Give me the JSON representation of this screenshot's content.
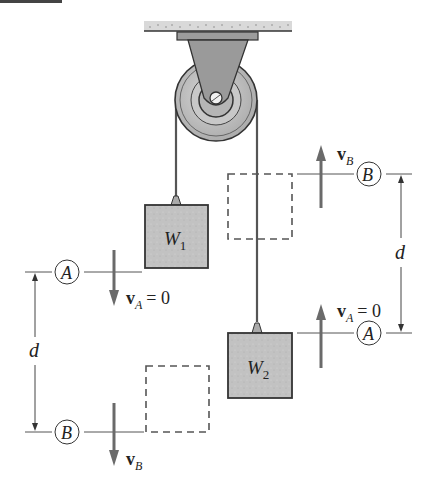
{
  "figure": {
    "type": "pulley-system-diagram",
    "masses": [
      {
        "id": "W1",
        "label_main": "W",
        "label_sub": "1"
      },
      {
        "id": "W2",
        "label_main": "W",
        "label_sub": "2"
      }
    ],
    "datums": {
      "left": {
        "upper": {
          "label": "A",
          "velocity_main": "v",
          "velocity_sub": "A",
          "velocity_eq": "= 0",
          "arrow": "down"
        },
        "lower": {
          "label": "B",
          "velocity_main": "v",
          "velocity_sub": "B",
          "velocity_eq": "",
          "arrow": "down"
        },
        "distance_label": "d"
      },
      "right": {
        "upper": {
          "label": "B",
          "velocity_main": "v",
          "velocity_sub": "B",
          "velocity_eq": "",
          "arrow": "up"
        },
        "lower": {
          "label": "A",
          "velocity_main": "v",
          "velocity_sub": "A",
          "velocity_eq": "= 0",
          "arrow": "up"
        },
        "distance_label": "d"
      }
    },
    "colors": {
      "mass_fill": "#bdbdbd",
      "pulley_fill": "#c4c4c4",
      "bracket_fill": "#9a9a9a",
      "ceiling_fill": "#d6d6d6",
      "arrow": "#6a6a6a",
      "line": "#333333",
      "dashed": "#555555"
    }
  }
}
